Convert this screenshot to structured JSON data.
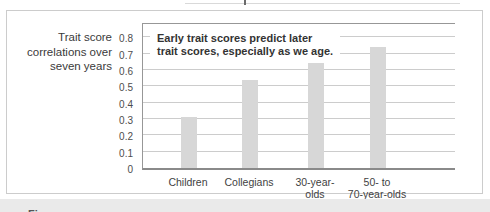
{
  "page": {
    "caption_fragment": "Figure"
  },
  "figure": {
    "side_label": "Trait score\ncorrelations over\nseven years",
    "annotation": "Early trait scores predict later\ntrait scores, especially as we age."
  },
  "chart_data": {
    "type": "bar",
    "title": "",
    "xlabel": "",
    "ylabel": "Trait score correlations over seven years",
    "categories": [
      "Children",
      "Collegians",
      "30-year-\nolds",
      "50- to\n70-year-olds"
    ],
    "values": [
      0.31,
      0.54,
      0.64,
      0.74
    ],
    "ylim": [
      0,
      0.9
    ],
    "ytick_labels": [
      "0",
      "0.1",
      "0.2",
      "0.3",
      "0.4",
      "0.5",
      "0.6",
      "0.7",
      "0.8"
    ],
    "grid": true,
    "legend": false,
    "annotation": "Early trait scores predict later trait scores, especially as we age.",
    "colors": {
      "bar": "#d7d7d7",
      "gridline": "#cccccc",
      "axis": "#979797",
      "text": "#3a3a3a",
      "caption_band": "#eaeaea"
    }
  }
}
